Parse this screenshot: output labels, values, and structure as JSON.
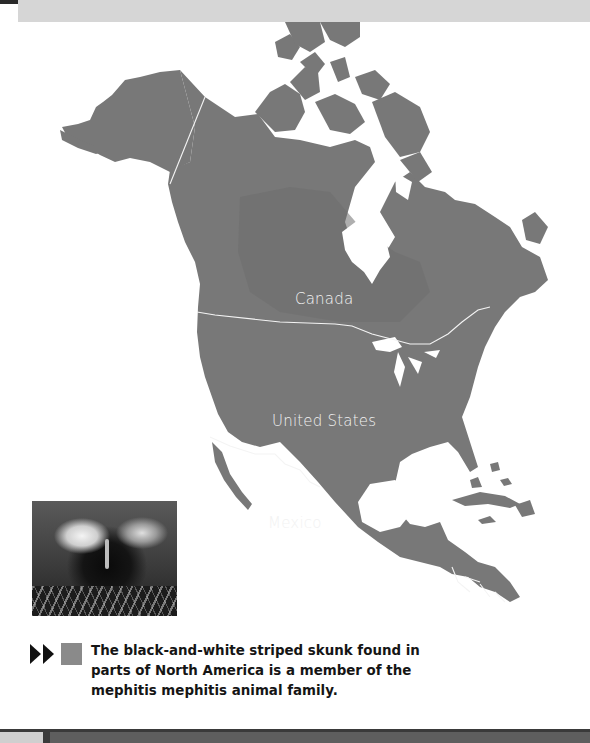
{
  "header": {
    "decorative_bar": true
  },
  "map": {
    "title": "North America skunk range",
    "land_color": "#787878",
    "range_color": "#6c6c6c",
    "water_color": "#ffffff",
    "border_color": "#f2f2f2",
    "labels": [
      {
        "id": "canada",
        "text": "Canada"
      },
      {
        "id": "united_states",
        "text": "United States"
      },
      {
        "id": "mexico",
        "text": "Mexico"
      }
    ]
  },
  "photo": {
    "subject": "striped skunk",
    "alt": "Black-and-white striped skunk in grass"
  },
  "legend": {
    "arrow_icon": "double-play-arrow-icon",
    "swatch_color": "#8a8a8a",
    "caption": "The black-and-white striped skunk found in parts of North America is a member of the mephitis mephitis animal family."
  },
  "footer": {
    "decorative_bar": true
  }
}
